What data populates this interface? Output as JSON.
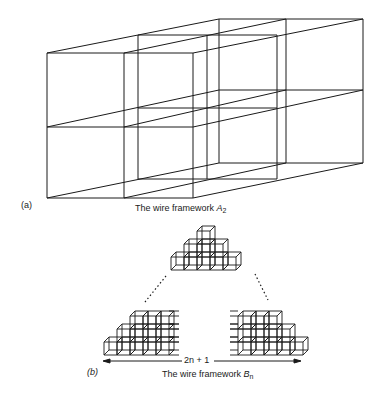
{
  "figure_a": {
    "panel_label": "(a)",
    "caption_prefix": "The wire framework ",
    "caption_symbol": "A",
    "caption_subscript": "2",
    "planes": [
      {
        "xs": [
          47,
          124,
          193
        ],
        "ys": [
          53,
          127,
          198
        ]
      },
      {
        "xs": [
          138,
          207,
          277
        ],
        "ys": [
          35,
          108,
          179
        ]
      },
      {
        "xs": [
          219,
          286,
          363
        ],
        "ys": [
          19,
          90,
          163
        ]
      }
    ]
  },
  "figure_b": {
    "panel_label": "(b)",
    "caption_prefix": "The wire framework ",
    "caption_symbol": "B",
    "caption_subscript": "n",
    "width_label": "2n + 1",
    "pyramid": {
      "origin": [
        171,
        270
      ],
      "cube": 13,
      "depth": [
        5,
        -5
      ],
      "rows": [
        [
          0,
          5
        ],
        [
          1,
          3
        ],
        [
          2,
          1
        ]
      ]
    },
    "left_block": {
      "origin": [
        104,
        355
      ],
      "cube": 13,
      "depth": [
        5,
        -5
      ],
      "rows": [
        [
          0,
          5
        ],
        [
          1,
          4
        ],
        [
          2,
          3
        ]
      ],
      "extend": "right"
    },
    "right_block": {
      "origin": [
        238,
        355
      ],
      "cube": 13,
      "depth": [
        5,
        -5
      ],
      "rows": [
        [
          0,
          5
        ],
        [
          0,
          4
        ],
        [
          0,
          3
        ]
      ],
      "extend": "left"
    }
  },
  "colors": {
    "ink": "#1a1a1a",
    "background": "#ffffff"
  }
}
